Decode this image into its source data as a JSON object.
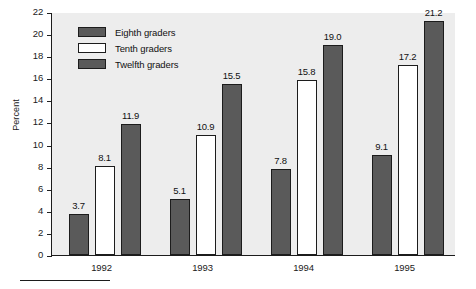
{
  "chart_data": {
    "type": "bar",
    "title": "",
    "subtitle": "",
    "xlabel": "",
    "ylabel": "Percent",
    "categories": [
      "1992",
      "1993",
      "1994",
      "1995"
    ],
    "series": [
      {
        "name": "Eighth graders",
        "color": "#5a5a5a",
        "values": [
          3.7,
          5.1,
          7.8,
          9.1
        ]
      },
      {
        "name": "Tenth graders",
        "color": "#ffffff",
        "values": [
          8.1,
          10.9,
          15.8,
          17.2
        ]
      },
      {
        "name": "Twelfth graders",
        "color": "#5a5a5a",
        "values": [
          11.9,
          15.5,
          19.0,
          21.2
        ]
      }
    ],
    "ylim": [
      0,
      22
    ],
    "yticks": [
      0,
      2,
      4,
      6,
      8,
      10,
      12,
      14,
      16,
      18,
      20,
      22
    ],
    "ytick_labels": [
      "0",
      "2",
      "4",
      "6",
      "8",
      "10",
      "12",
      "14",
      "16",
      "18",
      "20",
      "22"
    ],
    "data_labels": [
      [
        "3.7",
        "8.1",
        "11.9"
      ],
      [
        "5.1",
        "10.9",
        "15.5"
      ],
      [
        "7.8",
        "15.8",
        "19.0"
      ],
      [
        "9.1",
        "17.2",
        "21.2"
      ]
    ],
    "grid": false,
    "legend_position": "top-left",
    "plot_background": "#ededed",
    "figure_background": "#ffffff",
    "axis_color": "#1c1c1c",
    "bar_shadow_color": "#b9b9b9"
  },
  "legend": {
    "items": [
      {
        "label": "Eighth graders",
        "swatch": "dark"
      },
      {
        "label": "Tenth graders",
        "swatch": "white"
      },
      {
        "label": "Twelfth graders",
        "swatch": "dark"
      }
    ]
  },
  "axes": {
    "y_title": "Percent"
  }
}
